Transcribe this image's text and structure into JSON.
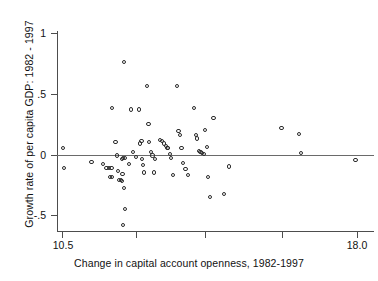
{
  "chart_data": {
    "type": "scatter",
    "title": "",
    "xlabel": "Change in capital account openness, 1982-1997",
    "ylabel": "Growth rate of per capita GDP: 1982 - 1997",
    "xlim": [
      10.5,
      18.0
    ],
    "ylim": [
      -0.62,
      1.12
    ],
    "xticks": [
      10.5,
      18.0
    ],
    "xtick_labels": [
      "10.5",
      "18.0"
    ],
    "xtick_all": [
      10.5,
      12.375,
      14.0,
      15.75,
      18.0
    ],
    "yticks": [
      1,
      0.5,
      0,
      -0.5
    ],
    "ytick_labels": [
      "1",
      ".5",
      "0",
      "-.5"
    ],
    "grid": false,
    "legend": null,
    "reference_lines": [
      {
        "axis": "y",
        "value": 0
      }
    ],
    "marker": "open-circle",
    "marker_color": "#2b2b2b",
    "n_points": 78,
    "points": [
      {
        "x": 10.53,
        "y": 0.05
      },
      {
        "x": 10.56,
        "y": -0.11
      },
      {
        "x": 11.25,
        "y": -0.06
      },
      {
        "x": 11.55,
        "y": -0.08
      },
      {
        "x": 11.63,
        "y": -0.11
      },
      {
        "x": 11.7,
        "y": -0.11
      },
      {
        "x": 11.76,
        "y": -0.11
      },
      {
        "x": 11.72,
        "y": -0.19
      },
      {
        "x": 11.78,
        "y": -0.19
      },
      {
        "x": 11.77,
        "y": 0.38
      },
      {
        "x": 11.86,
        "y": 0.1
      },
      {
        "x": 11.9,
        "y": -0.01
      },
      {
        "x": 11.92,
        "y": -0.14
      },
      {
        "x": 11.95,
        "y": -0.21
      },
      {
        "x": 11.99,
        "y": -0.21
      },
      {
        "x": 12.03,
        "y": -0.22
      },
      {
        "x": 12.04,
        "y": -0.16
      },
      {
        "x": 12.02,
        "y": -0.04
      },
      {
        "x": 12.06,
        "y": -0.03
      },
      {
        "x": 12.11,
        "y": -0.03
      },
      {
        "x": 12.08,
        "y": -0.28
      },
      {
        "x": 12.1,
        "y": -0.45
      },
      {
        "x": 12.06,
        "y": -0.58
      },
      {
        "x": 12.08,
        "y": 0.76
      },
      {
        "x": 12.21,
        "y": -0.08
      },
      {
        "x": 12.26,
        "y": 0.37
      },
      {
        "x": 12.3,
        "y": 0.02
      },
      {
        "x": 12.39,
        "y": -0.02
      },
      {
        "x": 12.45,
        "y": 0.37
      },
      {
        "x": 12.48,
        "y": 0.09
      },
      {
        "x": 12.52,
        "y": 0.11
      },
      {
        "x": 12.54,
        "y": -0.04
      },
      {
        "x": 12.55,
        "y": -0.09
      },
      {
        "x": 12.58,
        "y": -0.15
      },
      {
        "x": 12.67,
        "y": 0.56
      },
      {
        "x": 12.7,
        "y": 0.25
      },
      {
        "x": 12.72,
        "y": 0.1
      },
      {
        "x": 12.77,
        "y": 0.02
      },
      {
        "x": 12.8,
        "y": -0.01
      },
      {
        "x": 12.83,
        "y": -0.15
      },
      {
        "x": 12.86,
        "y": -0.04
      },
      {
        "x": 13.0,
        "y": 0.12
      },
      {
        "x": 13.05,
        "y": 0.11
      },
      {
        "x": 13.1,
        "y": 0.09
      },
      {
        "x": 13.14,
        "y": 0.07
      },
      {
        "x": 13.18,
        "y": 0.05
      },
      {
        "x": 13.2,
        "y": 0.05
      },
      {
        "x": 13.25,
        "y": 0.0
      },
      {
        "x": 13.28,
        "y": -0.03
      },
      {
        "x": 13.32,
        "y": -0.17
      },
      {
        "x": 13.42,
        "y": 0.56
      },
      {
        "x": 13.46,
        "y": 0.19
      },
      {
        "x": 13.5,
        "y": 0.16
      },
      {
        "x": 13.54,
        "y": 0.05
      },
      {
        "x": 13.58,
        "y": -0.07
      },
      {
        "x": 13.64,
        "y": -0.12
      },
      {
        "x": 13.7,
        "y": -0.17
      },
      {
        "x": 13.85,
        "y": 0.38
      },
      {
        "x": 13.9,
        "y": 0.16
      },
      {
        "x": 13.94,
        "y": 0.13
      },
      {
        "x": 13.98,
        "y": 0.03
      },
      {
        "x": 14.02,
        "y": 0.02
      },
      {
        "x": 14.06,
        "y": 0.01
      },
      {
        "x": 14.1,
        "y": 0.0
      },
      {
        "x": 14.14,
        "y": 0.2
      },
      {
        "x": 14.18,
        "y": 0.06
      },
      {
        "x": 14.22,
        "y": -0.19
      },
      {
        "x": 14.26,
        "y": -0.35
      },
      {
        "x": 14.35,
        "y": 0.3
      },
      {
        "x": 14.62,
        "y": -0.33
      },
      {
        "x": 14.74,
        "y": -0.1
      },
      {
        "x": 16.08,
        "y": 0.22
      },
      {
        "x": 16.52,
        "y": 0.17
      },
      {
        "x": 16.57,
        "y": 0.01
      },
      {
        "x": 17.96,
        "y": -0.05
      }
    ]
  },
  "axes": {
    "y_title": "Growth rate of per capita GDP: 1982 - 1997",
    "x_title": "Change in capital account openness, 1982-1997",
    "y_tick_labels": [
      "1",
      ".5",
      "0",
      "-.5"
    ],
    "x_tick_labels": [
      "10.5",
      "18.0"
    ]
  },
  "colors": {
    "marker_stroke": "#2b2b2b",
    "axis": "#4d4d4d",
    "zero_line": "#6a6a6a",
    "text": "#111111",
    "background": "#ffffff"
  }
}
